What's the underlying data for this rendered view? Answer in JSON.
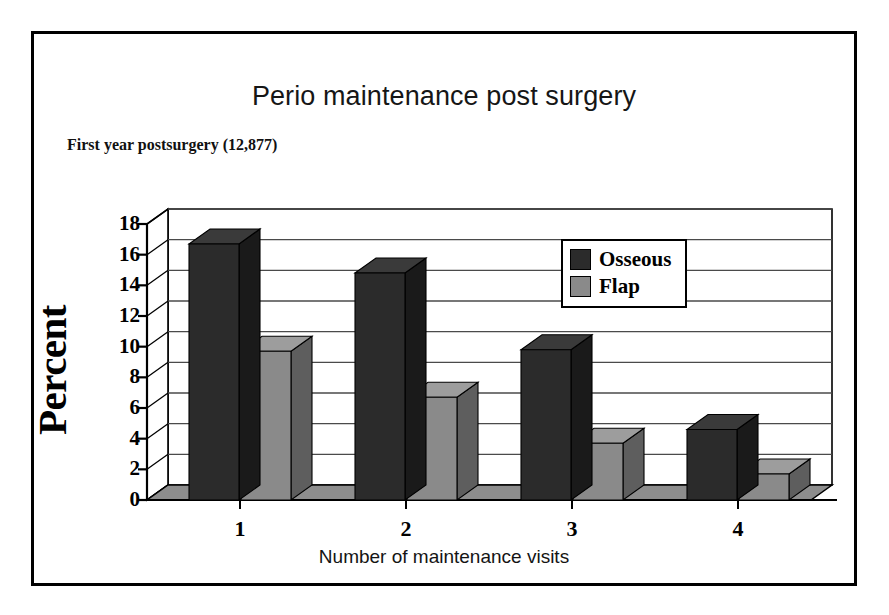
{
  "chart_data": {
    "type": "bar",
    "title": "Perio maintenance post surgery",
    "subtitle": "First year postsurgery (12,877)",
    "xlabel": "Number of maintenance visits",
    "ylabel": "Percent",
    "categories": [
      "1",
      "2",
      "3",
      "4"
    ],
    "series": [
      {
        "name": "Osseous",
        "color": "#2b2b2b",
        "values": [
          16.7,
          14.8,
          9.8,
          4.6
        ]
      },
      {
        "name": "Flap",
        "color": "#8a8a8a",
        "values": [
          9.7,
          6.7,
          3.7,
          1.7
        ]
      }
    ],
    "ylim": [
      0,
      18
    ],
    "ytick_values": [
      0,
      2,
      4,
      6,
      8,
      10,
      12,
      14,
      16,
      18
    ],
    "ytick_labels": [
      "0",
      "2",
      "4",
      "6",
      "8",
      "10",
      "12",
      "14",
      "16",
      "18"
    ],
    "grid": true,
    "legend_position": "inside-top-right",
    "style": "3d-column"
  },
  "colors": {
    "osseous": "#2b2b2b",
    "osseous_side": "#1a1a1a",
    "osseous_top": "#3a3a3a",
    "flap": "#8a8a8a",
    "flap_side": "#5e5e5e",
    "flap_top": "#9d9d9d",
    "floor": "#8d8d8d",
    "axis": "#000000",
    "grid": "#4a4a4a",
    "frame": "#000000",
    "background": "#ffffff"
  },
  "legend": {
    "items": [
      {
        "label": "Osseous",
        "swatch": "#2b2b2b"
      },
      {
        "label": "Flap",
        "swatch": "#8a8a8a"
      }
    ]
  }
}
